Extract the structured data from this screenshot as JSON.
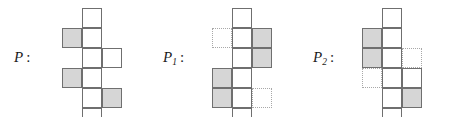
{
  "figure": {
    "caption_symbols": [
      "P",
      "P1",
      "P2"
    ],
    "cell_size": 20,
    "grid_rows": 6,
    "grid_cols": 3,
    "colors": {
      "stroke": "#6f6f6f",
      "shade_fill": "#d6d6d6",
      "dotted_stroke": "#a8a8a8",
      "background": "#ffffff",
      "text": "#1a1a1a"
    }
  },
  "panels": [
    {
      "id": "panel-p",
      "label": {
        "base": "P",
        "sub": "",
        "colon": ":"
      },
      "label_x": 14,
      "label_y": 50,
      "grid_x": 62,
      "grid_y": 8,
      "cells": [
        {
          "row": 0,
          "col": 1,
          "style": "solid",
          "shaded": false
        },
        {
          "row": 1,
          "col": 0,
          "style": "solid",
          "shaded": true
        },
        {
          "row": 1,
          "col": 1,
          "style": "solid",
          "shaded": false
        },
        {
          "row": 2,
          "col": 1,
          "style": "solid",
          "shaded": false
        },
        {
          "row": 2,
          "col": 2,
          "style": "solid",
          "shaded": false
        },
        {
          "row": 3,
          "col": 0,
          "style": "solid",
          "shaded": true
        },
        {
          "row": 3,
          "col": 1,
          "style": "solid",
          "shaded": false
        },
        {
          "row": 4,
          "col": 1,
          "style": "solid",
          "shaded": false
        },
        {
          "row": 4,
          "col": 2,
          "style": "solid",
          "shaded": true
        },
        {
          "row": 5,
          "col": 1,
          "style": "solid",
          "shaded": false
        }
      ]
    },
    {
      "id": "panel-p1",
      "label": {
        "base": "P",
        "sub": "1",
        "colon": ":"
      },
      "label_x": 163,
      "label_y": 50,
      "grid_x": 212,
      "grid_y": 8,
      "cells": [
        {
          "row": 0,
          "col": 1,
          "style": "solid",
          "shaded": false
        },
        {
          "row": 1,
          "col": 0,
          "style": "dotted",
          "shaded": false
        },
        {
          "row": 1,
          "col": 1,
          "style": "solid",
          "shaded": false
        },
        {
          "row": 1,
          "col": 2,
          "style": "solid",
          "shaded": true
        },
        {
          "row": 2,
          "col": 1,
          "style": "solid",
          "shaded": false
        },
        {
          "row": 2,
          "col": 2,
          "style": "solid",
          "shaded": true
        },
        {
          "row": 3,
          "col": 0,
          "style": "solid",
          "shaded": true
        },
        {
          "row": 3,
          "col": 1,
          "style": "solid",
          "shaded": false
        },
        {
          "row": 4,
          "col": 0,
          "style": "solid",
          "shaded": true
        },
        {
          "row": 4,
          "col": 1,
          "style": "solid",
          "shaded": false
        },
        {
          "row": 4,
          "col": 2,
          "style": "dotted",
          "shaded": false
        },
        {
          "row": 5,
          "col": 1,
          "style": "solid",
          "shaded": false
        }
      ]
    },
    {
      "id": "panel-p2",
      "label": {
        "base": "P",
        "sub": "2",
        "colon": ":"
      },
      "label_x": 313,
      "label_y": 50,
      "grid_x": 362,
      "grid_y": 8,
      "cells": [
        {
          "row": 0,
          "col": 1,
          "style": "solid",
          "shaded": false
        },
        {
          "row": 1,
          "col": 0,
          "style": "solid",
          "shaded": true
        },
        {
          "row": 1,
          "col": 1,
          "style": "solid",
          "shaded": false
        },
        {
          "row": 2,
          "col": 0,
          "style": "solid",
          "shaded": true
        },
        {
          "row": 2,
          "col": 1,
          "style": "solid",
          "shaded": false
        },
        {
          "row": 2,
          "col": 2,
          "style": "dotted",
          "shaded": false
        },
        {
          "row": 3,
          "col": 0,
          "style": "dotted",
          "shaded": false
        },
        {
          "row": 3,
          "col": 1,
          "style": "solid",
          "shaded": false
        },
        {
          "row": 3,
          "col": 2,
          "style": "solid",
          "shaded": false
        },
        {
          "row": 4,
          "col": 1,
          "style": "solid",
          "shaded": false
        },
        {
          "row": 4,
          "col": 2,
          "style": "solid",
          "shaded": true
        },
        {
          "row": 5,
          "col": 1,
          "style": "solid",
          "shaded": false
        }
      ]
    }
  ]
}
